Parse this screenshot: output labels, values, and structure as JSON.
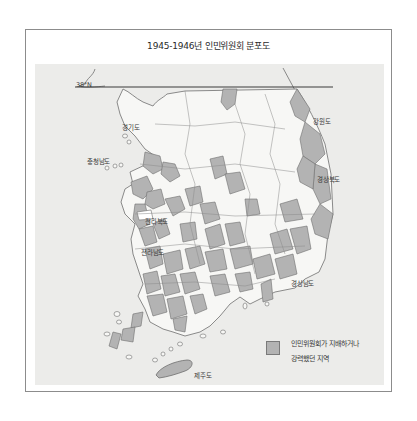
{
  "title": "1945-1946년 인민위원회 분포도",
  "map": {
    "parallel_label": "38°N",
    "regions": {
      "gyeonggi": "경기도",
      "gangwon": "강원도",
      "chungnam": "충청남도",
      "gyeongbuk": "경상북도",
      "jeonbuk": "전라북도",
      "jeonnam": "전라남도",
      "gyeongnam": "경상남도",
      "jeju": "제주도"
    }
  },
  "legend": {
    "line1": "인민위원회가 지배하거나",
    "line2": "강력했던 지역"
  },
  "colors": {
    "panel_bg": "#ececea",
    "land": "#f7f7f5",
    "committee_area": "#b3b3b3",
    "border": "#6f6f6f"
  }
}
